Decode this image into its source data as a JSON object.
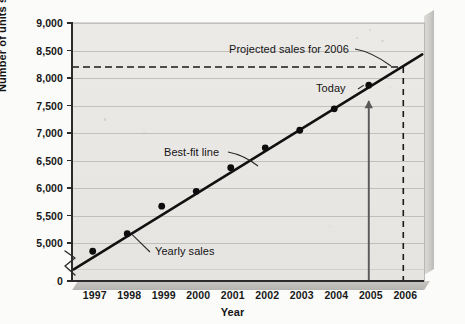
{
  "chart_data": {
    "type": "scatter",
    "title": "",
    "subtitle": "",
    "xlabel": "Year",
    "ylabel": "Number of units sold",
    "grid": true,
    "legend_position": "none",
    "axis_break": true,
    "axis_break_note": "y-axis broken between 0 and 5,000",
    "xlim": [
      1996.4,
      2006.6
    ],
    "ylim": [
      5000,
      9000
    ],
    "x_tick_labels": [
      "1997",
      "1998",
      "1999",
      "2000",
      "2001",
      "2002",
      "2003",
      "2004",
      "2005",
      "2006"
    ],
    "y_tick_labels": [
      "0",
      "5,000",
      "5,500",
      "6,000",
      "6,500",
      "7,000",
      "7,500",
      "8,000",
      "8,500",
      "9,000"
    ],
    "y_tick_values": [
      0,
      5000,
      5500,
      6000,
      6500,
      7000,
      7500,
      8000,
      8500,
      9000
    ],
    "categories": [
      1997,
      1998,
      1999,
      2000,
      2001,
      2002,
      2003,
      2004,
      2005
    ],
    "series": [
      {
        "name": "Yearly sales",
        "type": "scatter",
        "x": [
          1997,
          1998,
          1999,
          2000,
          2001,
          2002,
          2003,
          2004,
          2005
        ],
        "values": [
          4850,
          5170,
          5670,
          5940,
          6370,
          6730,
          7050,
          7440,
          7870
        ]
      },
      {
        "name": "Best-fit line",
        "type": "line",
        "x": [
          1996.45,
          2006.55
        ],
        "values": [
          4520,
          8430
        ]
      }
    ],
    "reference_lines": [
      {
        "name": "projected-sales-level",
        "orientation": "horizontal",
        "value": 8200,
        "style": "dashed"
      },
      {
        "name": "projection-year",
        "orientation": "vertical",
        "value": 2006,
        "style": "dashed"
      },
      {
        "name": "today-marker",
        "orientation": "vertical",
        "value": 2005,
        "style": "solid-arrow"
      }
    ],
    "annotations": [
      {
        "name": "projected-sales-label",
        "text": "Projected sales for 2006",
        "points_to": "projected-sales-level"
      },
      {
        "name": "today-label",
        "text": "Today",
        "points_to": "point 2005 = 7,870"
      },
      {
        "name": "best-fit-line-label",
        "text": "Best-fit line",
        "points_to": "best-fit trend line"
      },
      {
        "name": "yearly-sales-label",
        "text": "Yearly sales",
        "points_to": "data point 1998"
      }
    ],
    "colors": {
      "plot_background": "#eae8e5",
      "gridline": "#a9a7a3",
      "axis": "#2b2b2b",
      "data_line": "#111111",
      "data_point": "#0d0d0d",
      "today_arrow": "#595959",
      "page_background": "#fbfbf9"
    }
  }
}
